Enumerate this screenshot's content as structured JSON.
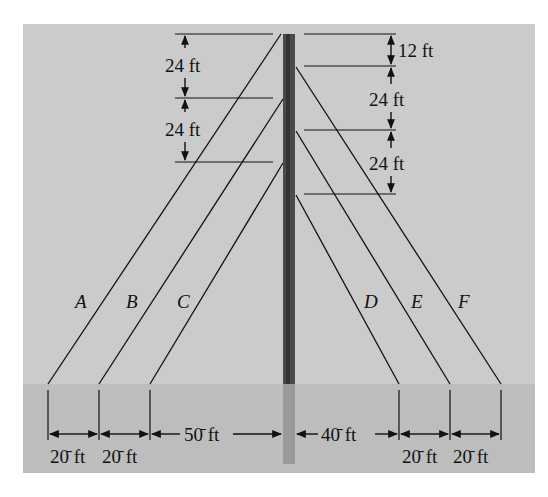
{
  "figure": {
    "colors": {
      "sky": "#cbcbcb",
      "ground": "#bdbdbd",
      "pole_above": "#4a4a4a",
      "pole_below": "#9a9a9a",
      "line": "#111111"
    },
    "cables": [
      {
        "label": "A",
        "side": "left"
      },
      {
        "label": "B",
        "side": "left"
      },
      {
        "label": "C",
        "side": "left"
      },
      {
        "label": "D",
        "side": "right"
      },
      {
        "label": "E",
        "side": "right"
      },
      {
        "label": "F",
        "side": "right"
      }
    ],
    "left_heights": [
      "24 ft",
      "24 ft"
    ],
    "right_heights": [
      "12 ft",
      "24 ft",
      "24 ft"
    ],
    "ground_spacings": {
      "A_to_B": "20̄ ft",
      "B_to_C": "20̄ ft",
      "C_to_pole": "50̄ ft",
      "pole_to_D": "40̄ ft",
      "D_to_E": "20̄ ft",
      "E_to_F": "20̄ ft"
    }
  }
}
